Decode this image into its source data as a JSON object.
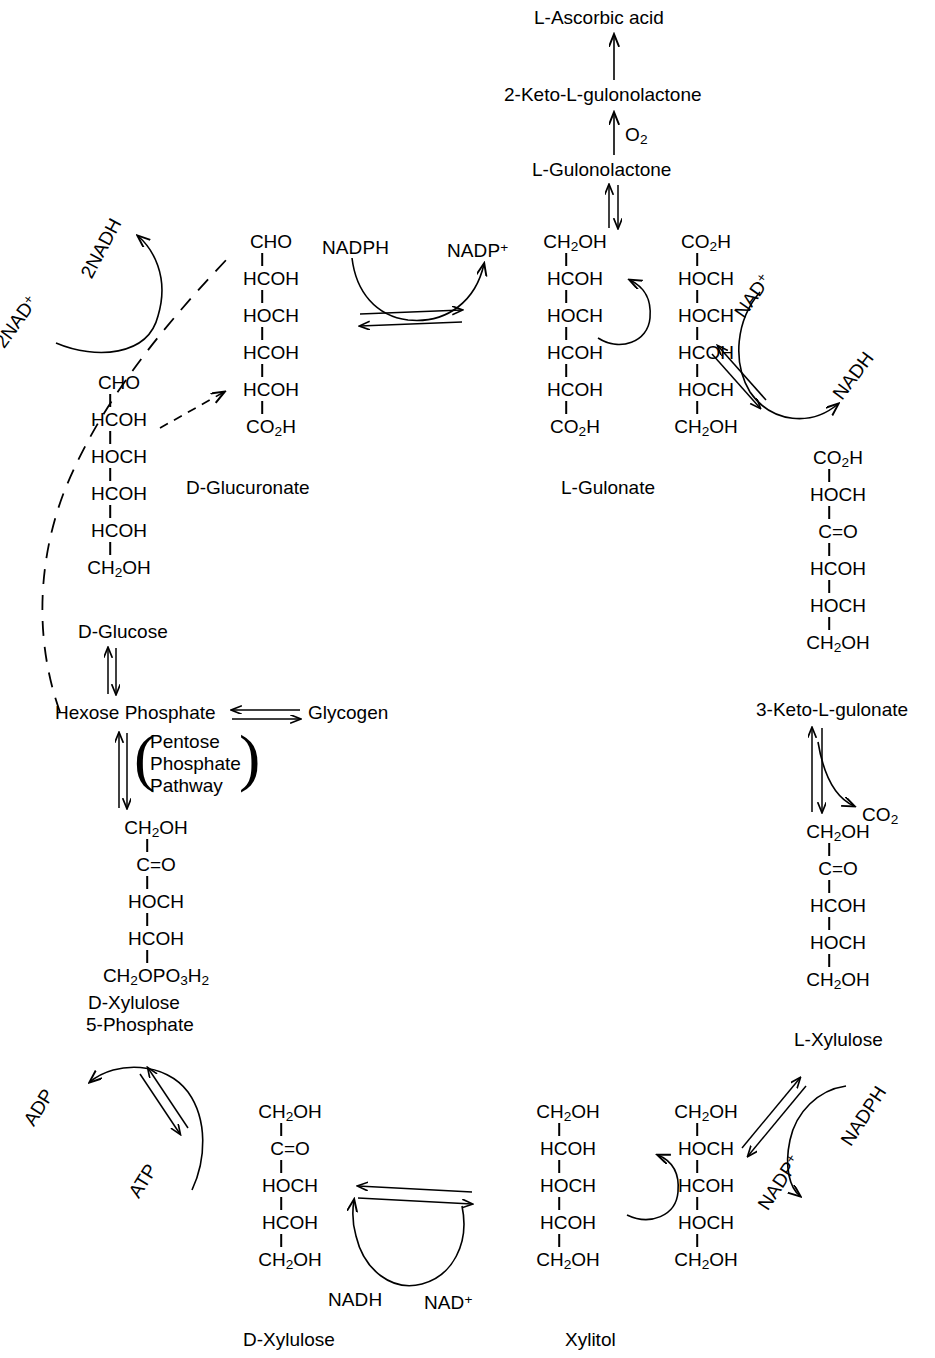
{
  "diagram": {
    "ink_color": "#000000",
    "background": "#ffffff"
  },
  "nodes": {
    "ascorbic_acid": "L-Ascorbic acid",
    "keto_gulonolactone": "2-Keto-L-gulonolactone",
    "gulonolactone": "L-Gulonolactone",
    "d_glucuronate": "D-Glucuronate",
    "d_glucose": "D-Glucose",
    "hexose_phosphate": "Hexose Phosphate",
    "glycogen": "Glycogen",
    "l_gulonate": "L-Gulonate",
    "keto3_l_gulonate": "3-Keto-L-gulonate",
    "l_xylulose": "L-Xylulose",
    "xylitol": "Xylitol",
    "d_xylulose": "D-Xylulose",
    "d_xylulose_5p_line1": "D-Xylulose",
    "d_xylulose_5p_line2": "5-Phosphate"
  },
  "cofactors": {
    "two_nadh": "2NADH",
    "two_nad_plus": "2NAD+",
    "nadph_top": "NADPH",
    "nadp_plus_top": "NADP+",
    "nad_plus_right": "NAD+",
    "nadh_right": "NADH",
    "o2": "O2",
    "co2_right": "CO2",
    "adp": "ADP",
    "atp": "ATP",
    "nadh_bottom": "NADH",
    "nad_plus_bottom": "NAD+",
    "nadph_bottom_right": "NADPH",
    "nadp_plus_bottom_right": "NADP+"
  },
  "pathway_box": {
    "line1": "Pentose",
    "line2": "Phosphate",
    "line3": "Pathway"
  },
  "structures": {
    "d_glucuronate": {
      "label": "D-Glucuronate",
      "rows": [
        "CHO",
        "HCOH",
        "HOCH",
        "HCOH",
        "HCOH",
        "CO2H"
      ]
    },
    "d_glucose": {
      "label": "D-Glucose",
      "rows": [
        "CHO",
        "HCOH",
        "HOCH",
        "HCOH",
        "HCOH",
        "CH2OH"
      ]
    },
    "l_gulonate_left": {
      "label": "L-Gulonate",
      "rows": [
        "CH2OH",
        "HCOH",
        "HOCH",
        "HCOH",
        "HCOH",
        "CO2H"
      ]
    },
    "l_gulonate_right": {
      "label": "",
      "rows": [
        "CO2H",
        "HOCH",
        "HOCH",
        "HCOH",
        "HOCH",
        "CH2OH"
      ]
    },
    "keto3_l_gulonate": {
      "label": "3-Keto-L-gulonate",
      "rows": [
        "CO2H",
        "HOCH",
        "C=O",
        "HCOH",
        "HOCH",
        "CH2OH"
      ]
    },
    "l_xylulose": {
      "label": "L-Xylulose",
      "rows": [
        "CH2OH",
        "C=O",
        "HCOH",
        "HOCH",
        "CH2OH"
      ]
    },
    "xylitol_left": {
      "label": "Xylitol",
      "rows": [
        "CH2OH",
        "HCOH",
        "HOCH",
        "HCOH",
        "CH2OH"
      ]
    },
    "xylitol_right": {
      "label": "",
      "rows": [
        "CH2OH",
        "HOCH",
        "HCOH",
        "HOCH",
        "CH2OH"
      ]
    },
    "d_xylulose": {
      "label": "D-Xylulose",
      "rows": [
        "CH2OH",
        "C=O",
        "HOCH",
        "HCOH",
        "CH2OH"
      ]
    },
    "d_xylulose_5_phosphate": {
      "label": "D-Xylulose 5-Phosphate",
      "rows": [
        "CH2OH",
        "C=O",
        "HOCH",
        "HCOH",
        "CH2OPO3H2"
      ]
    }
  }
}
